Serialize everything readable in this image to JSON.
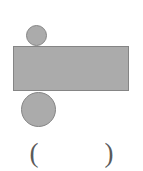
{
  "figure": {
    "background_color": "#ffffff",
    "shape_fill_color": "#ababab",
    "shape_stroke_color": "#858585",
    "shapes": [
      {
        "name": "circle-small",
        "type": "circle",
        "fill": "#ababab",
        "stroke": "#858585",
        "x": 26,
        "y": 25,
        "width": 21,
        "height": 21,
        "diameter": 21,
        "position_note": "tangent above the rectangle"
      },
      {
        "name": "rectangle",
        "type": "rectangle",
        "fill": "#ababab",
        "stroke": "#858585",
        "x": 13,
        "y": 46,
        "width": 116,
        "height": 45,
        "position_note": "horizontal bar spanning most of the image width"
      },
      {
        "name": "circle-large",
        "type": "circle",
        "fill": "#ababab",
        "stroke": "#858585",
        "x": 21,
        "y": 92,
        "width": 35,
        "height": 35,
        "diameter": 35,
        "position_note": "tangent below the rectangle, toward the left"
      }
    ]
  },
  "answer": {
    "open_paren": "(",
    "close_paren": ")",
    "value": "",
    "placeholder": ""
  }
}
